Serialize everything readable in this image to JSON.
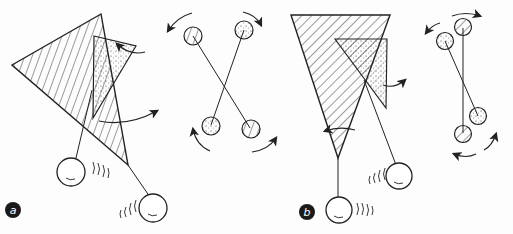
{
  "figure": {
    "panels": [
      {
        "id": "a",
        "label": "a"
      },
      {
        "id": "b",
        "label": "b"
      }
    ],
    "colors": {
      "ink": "#222222",
      "background": "#fdfdfd",
      "badge": "#1a1a1a",
      "badge_text": "#ffffff"
    }
  }
}
